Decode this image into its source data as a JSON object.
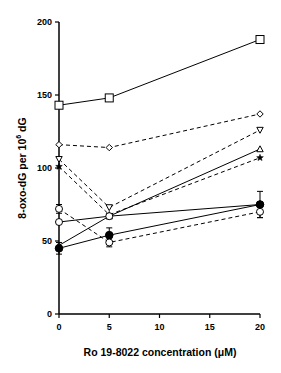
{
  "chart_data": {
    "type": "line",
    "title": "",
    "xlabel": "Ro 19-8022 concentration (μM)",
    "ylabel": "8-oxo-dG per 10^6 dG",
    "ylabel_parts": {
      "main": "8-oxo-dG per 10",
      "sup": "6",
      "tail": " dG"
    },
    "xlim": [
      0,
      20
    ],
    "ylim": [
      0,
      200
    ],
    "x": [
      0,
      5,
      20
    ],
    "xticks": [
      0,
      5,
      10,
      15,
      20
    ],
    "xtick_labels": [
      "0",
      "5",
      "10",
      "15",
      "20"
    ],
    "yticks": [
      0,
      50,
      100,
      150,
      200
    ],
    "ytick_labels": [
      "0",
      "50",
      "100",
      "150",
      "200"
    ],
    "grid": false,
    "legend": "none",
    "series": [
      {
        "name": "square",
        "marker": "square-open",
        "line": "solid",
        "values": [
          143,
          148,
          188
        ]
      },
      {
        "name": "diamond",
        "marker": "diamond-open",
        "line": "dashed",
        "values": [
          116,
          114,
          137
        ]
      },
      {
        "name": "inverted-triangle",
        "marker": "triangle-down-open",
        "line": "dashed",
        "values": [
          106,
          73,
          126
        ]
      },
      {
        "name": "star",
        "marker": "star-filled",
        "line": "dashed",
        "values": [
          101,
          68,
          107
        ]
      },
      {
        "name": "triangle",
        "marker": "triangle-up-open",
        "line": "solid",
        "values": [
          47,
          67,
          113
        ]
      },
      {
        "name": "open-circle-solid",
        "marker": "circle-open",
        "line": "solid",
        "values": [
          63,
          67,
          75
        ]
      },
      {
        "name": "filled-circle",
        "marker": "circle-filled",
        "line": "solid",
        "values": [
          45,
          54,
          75
        ],
        "error": [
          4,
          5,
          9
        ]
      },
      {
        "name": "open-circle-dashed",
        "marker": "circle-open",
        "line": "dashed",
        "values": [
          72,
          49,
          70
        ],
        "error": [
          3,
          3,
          4
        ]
      }
    ]
  }
}
